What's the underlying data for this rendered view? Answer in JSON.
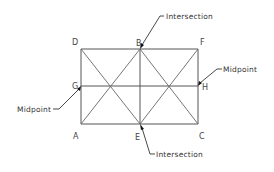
{
  "diagram": {
    "type": "geometry-construction",
    "points": {
      "D": {
        "label": "D",
        "x": 81,
        "y": 49
      },
      "B": {
        "label": "B",
        "x": 140,
        "y": 49
      },
      "F": {
        "label": "F",
        "x": 198,
        "y": 49
      },
      "G": {
        "label": "G",
        "x": 81,
        "y": 86
      },
      "H": {
        "label": "H",
        "x": 198,
        "y": 86
      },
      "A": {
        "label": "A",
        "x": 81,
        "y": 124
      },
      "E": {
        "label": "E",
        "x": 140,
        "y": 124
      },
      "C": {
        "label": "C",
        "x": 198,
        "y": 124
      }
    },
    "segments": [
      [
        "D",
        "F"
      ],
      [
        "F",
        "C"
      ],
      [
        "C",
        "A"
      ],
      [
        "A",
        "D"
      ],
      [
        "G",
        "H"
      ],
      [
        "B",
        "E"
      ],
      [
        "D",
        "E"
      ],
      [
        "B",
        "A"
      ],
      [
        "B",
        "C"
      ],
      [
        "F",
        "E"
      ]
    ],
    "callouts": [
      {
        "id": "top-intersection",
        "text": "Intersection",
        "target": "B"
      },
      {
        "id": "right-midpoint",
        "text": "Midpoint",
        "target": "H"
      },
      {
        "id": "left-midpoint",
        "text": "Midpoint",
        "target": "G"
      },
      {
        "id": "bottom-intersection",
        "text": "Intersection",
        "target": "E"
      }
    ]
  },
  "labels": {
    "D": "D",
    "B": "B",
    "F": "F",
    "G": "G",
    "H": "H",
    "A": "A",
    "E": "E",
    "C": "C"
  },
  "callouts": {
    "top_intersection": "Intersection",
    "right_midpoint": "Midpoint",
    "left_midpoint": "Midpoint",
    "bottom_intersection": "Intersection"
  },
  "colors": {
    "background": "#ffffff",
    "lines": "#555555",
    "text": "#444444"
  }
}
